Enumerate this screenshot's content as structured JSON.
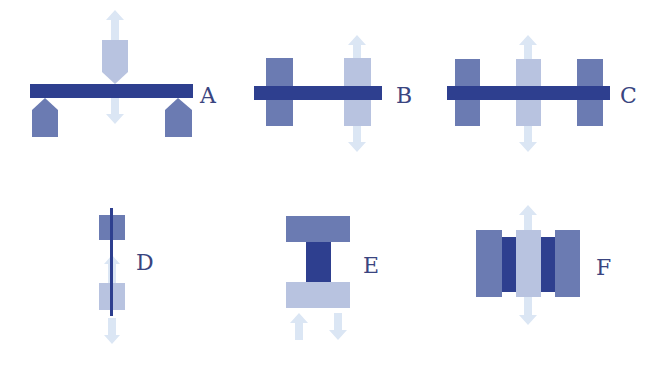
{
  "colors": {
    "beam": "#2e3f8f",
    "medium": "#6b7bb2",
    "light": "#b8c3e0",
    "arrow": "#dbe6f4",
    "label": "#3a4580"
  },
  "panels": [
    {
      "id": "A",
      "label": "A",
      "description": "three-point bending: beam on two supports, load from top"
    },
    {
      "id": "B",
      "label": "B",
      "description": "beam between fixed block and moving block"
    },
    {
      "id": "C",
      "label": "C",
      "description": "beam through three blocks, center block moving"
    },
    {
      "id": "D",
      "label": "D",
      "description": "vertical fiber between two blocks"
    },
    {
      "id": "E",
      "label": "E",
      "description": "sample sandwiched between two plates"
    },
    {
      "id": "F",
      "label": "F",
      "description": "double-lap shear: center block between two samples and outer blocks"
    }
  ]
}
